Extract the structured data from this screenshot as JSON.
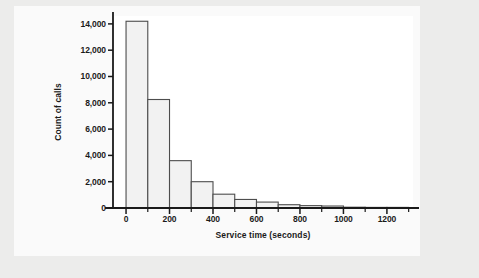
{
  "chart_data": {
    "type": "bar",
    "title": "",
    "subtitle": "",
    "xlabel": "Service time (seconds)",
    "ylabel": "Count of calls",
    "xlim": [
      -60,
      1320
    ],
    "ylim": [
      0,
      14600
    ],
    "grid": false,
    "legend": null,
    "bin_width": 100,
    "x_tick_labels": [
      "0",
      "200",
      "400",
      "600",
      "800",
      "1000",
      "1200"
    ],
    "x_tick_values": [
      0,
      200,
      400,
      600,
      800,
      1000,
      1200
    ],
    "x_minor_tick_values": [
      100,
      300,
      500,
      700,
      900,
      1100,
      1300
    ],
    "y_tick_labels": [
      "0",
      "2,000",
      "4,000",
      "6,000",
      "8,000",
      "10,000",
      "12,000",
      "14,000"
    ],
    "y_tick_values": [
      0,
      2000,
      4000,
      6000,
      8000,
      10000,
      12000,
      14000
    ],
    "bin_edges": [
      0,
      100,
      200,
      300,
      400,
      500,
      600,
      700,
      800,
      900,
      1000,
      1100,
      1200,
      1300
    ],
    "categories": [
      "0-100",
      "100-200",
      "200-300",
      "300-400",
      "400-500",
      "500-600",
      "600-700",
      "700-800",
      "800-900",
      "900-1000",
      "1000-1100",
      "1100-1200",
      "1200-1300"
    ],
    "values": [
      14200,
      8250,
      3600,
      2000,
      1050,
      650,
      450,
      250,
      180,
      150,
      60,
      30,
      20
    ],
    "colors": {
      "bar_fill": "#f2f2f2",
      "bar_edge": "#4d4d4d",
      "axis": "#1a1a1a",
      "panel_background": "#fafafa",
      "plot_background": "#ffffff",
      "page_background": "#ececeb",
      "text": "#1a1a1a"
    }
  }
}
